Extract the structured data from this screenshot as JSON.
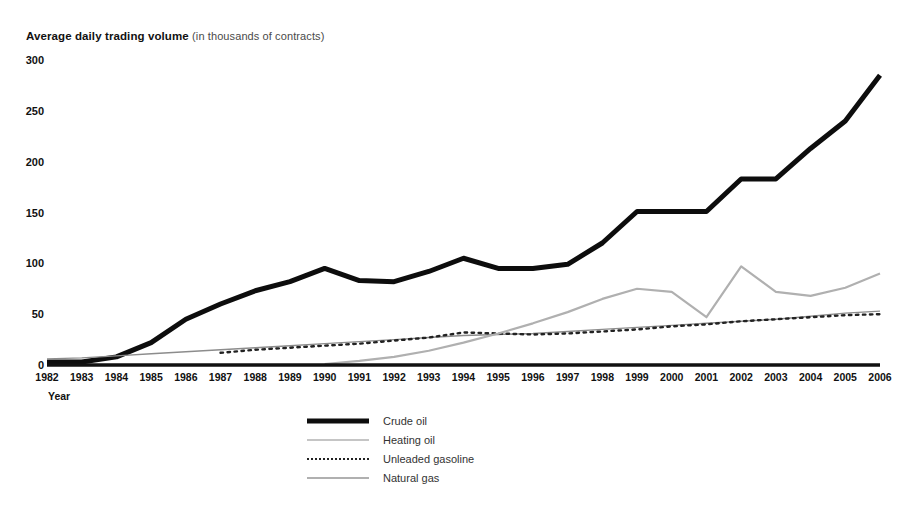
{
  "chart_data": {
    "type": "line",
    "title": "Average daily trading volume",
    "title_note": "(in thousands of contracts)",
    "xlabel": "Year",
    "ylabel": "",
    "grid": false,
    "legend_position": "bottom-center",
    "ylim": [
      0,
      300
    ],
    "yticks": [
      0,
      50,
      100,
      150,
      200,
      250,
      300
    ],
    "xlim": [
      1982,
      2006
    ],
    "categories": [
      1982,
      1983,
      1984,
      1985,
      1986,
      1987,
      1988,
      1989,
      1990,
      1991,
      1992,
      1993,
      1994,
      1995,
      1996,
      1997,
      1998,
      1999,
      2000,
      2001,
      2002,
      2003,
      2004,
      2005,
      2006
    ],
    "series": [
      {
        "name": "Crude oil",
        "style": "thick-solid",
        "color": "#0d0d0d",
        "values": [
          3,
          3,
          8,
          22,
          45,
          60,
          73,
          82,
          95,
          83,
          82,
          92,
          105,
          95,
          95,
          99,
          120,
          151,
          151,
          151,
          183,
          183,
          213,
          240,
          285
        ]
      },
      {
        "name": "Heating oil",
        "style": "thin-solid",
        "color": "#8c8c8c",
        "values": [
          6,
          7,
          9,
          11,
          13,
          15,
          17,
          19,
          21,
          23,
          25,
          27,
          29,
          30,
          31,
          33,
          35,
          37,
          39,
          41,
          43,
          45,
          48,
          51,
          53
        ]
      },
      {
        "name": "Unleaded gasoline",
        "style": "dotted",
        "color": "#222222",
        "values": [
          null,
          null,
          null,
          null,
          null,
          12,
          15,
          17,
          19,
          21,
          24,
          27,
          32,
          31,
          30,
          31,
          33,
          35,
          38,
          40,
          43,
          45,
          47,
          49,
          50
        ]
      },
      {
        "name": "Natural gas",
        "style": "thin-solid-gray",
        "color": "#b0b0b0",
        "values": [
          null,
          null,
          null,
          null,
          null,
          null,
          null,
          null,
          1,
          4,
          8,
          14,
          22,
          31,
          41,
          52,
          65,
          75,
          72,
          47,
          97,
          72,
          68,
          76,
          90
        ]
      }
    ]
  }
}
